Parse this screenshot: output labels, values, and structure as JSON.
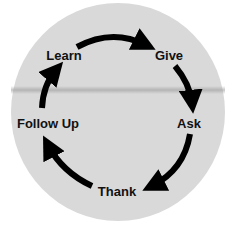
{
  "diagram": {
    "type": "cycle",
    "background_color": "#d9d9d9",
    "arrow_color": "#000000",
    "text_color": "#111111",
    "nodes": [
      {
        "label": "Learn"
      },
      {
        "label": "Give"
      },
      {
        "label": "Ask"
      },
      {
        "label": "Thank"
      },
      {
        "label": "Follow Up"
      }
    ],
    "flow": [
      "Learn",
      "Give",
      "Ask",
      "Thank",
      "Follow Up",
      "Learn"
    ]
  }
}
